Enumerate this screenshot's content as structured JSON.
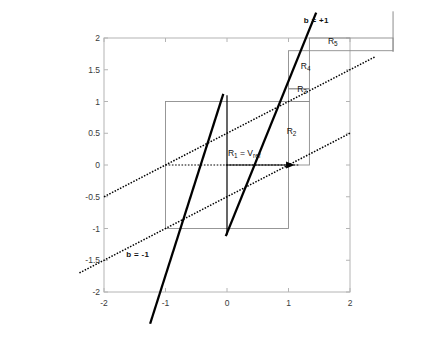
{
  "chart_data": {
    "type": "line",
    "title": "",
    "xlabel": "",
    "ylabel": "",
    "xlim": [
      -2,
      2
    ],
    "ylim": [
      -2,
      2
    ],
    "grid": false,
    "legend_position": "none",
    "x_ticks": [
      "-2",
      "-1",
      "0",
      "1",
      "2"
    ],
    "x_tick_values": [
      -2,
      -1,
      0,
      1,
      2
    ],
    "y_ticks": [
      "2",
      "1.5",
      "1",
      "0.5",
      "0",
      "-0.5",
      "-1",
      "-1.5",
      "-2"
    ],
    "y_tick_values": [
      2,
      1.5,
      1,
      0.5,
      0,
      -0.5,
      -1,
      -1.5,
      -2
    ],
    "series": [
      {
        "name": "b = +1",
        "style": "dotted",
        "color": "#000000",
        "slope": 0.5,
        "intercept": 0.5,
        "points": [
          [
            -2,
            -0.5
          ],
          [
            2.4,
            1.7
          ]
        ]
      },
      {
        "name": "b = -1",
        "style": "dotted",
        "color": "#000000",
        "slope": 0.5,
        "intercept": -0.5,
        "points": [
          [
            -2.4,
            -1.7
          ],
          [
            2.0,
            0.5
          ]
        ]
      },
      {
        "name": "map-branch-left",
        "style": "thick-solid",
        "color": "#000000",
        "points": [
          [
            -0.06,
            1.12
          ],
          [
            -1.25,
            -2.5
          ]
        ]
      },
      {
        "name": "map-branch-right",
        "style": "thick-solid",
        "color": "#000000",
        "points": [
          [
            -0.02,
            -1.12
          ],
          [
            1.45,
            2.4
          ]
        ]
      },
      {
        "name": "identity-vertical-x0",
        "style": "thin-solid",
        "color": "#000000",
        "points": [
          [
            0,
            1.1
          ],
          [
            0,
            -1.1
          ]
        ]
      }
    ],
    "annotations": [
      {
        "label": "b = +1",
        "x": 1.45,
        "y": 2.26,
        "bold": true
      },
      {
        "label": "b = -1",
        "x": -1.45,
        "y": -1.42,
        "bold": true
      },
      {
        "label": "R",
        "sub": "1",
        "suffix": " = V",
        "suffix_sub": "ref",
        "x": 0.28,
        "y": 0.18
      },
      {
        "label": "R",
        "sub": "2",
        "x": 1.05,
        "y": 0.52
      },
      {
        "label": "R",
        "sub": "3",
        "x": 1.22,
        "y": 1.18
      },
      {
        "label": "R",
        "sub": "4",
        "x": 1.28,
        "y": 1.55
      },
      {
        "label": "R",
        "sub": "5",
        "x": 1.72,
        "y": 1.93
      }
    ],
    "shapes": [
      {
        "name": "outer-axes-box",
        "type": "rect",
        "x0": -2,
        "y0": -2,
        "x1": 2,
        "y1": 2,
        "color": "#b0b0b0"
      },
      {
        "name": "inner-unit-box",
        "type": "rect",
        "x0": -1,
        "y0": -1,
        "x1": 1,
        "y1": 1,
        "color": "#8d8d8d"
      },
      {
        "name": "R2-region-box",
        "type": "rect",
        "x0": 1,
        "y0": 0,
        "x1": 1.34,
        "y1": 1,
        "color": "#8d8d8d"
      },
      {
        "name": "R3-region-box",
        "type": "rect",
        "x0": 1,
        "y0": 1,
        "x1": 1.34,
        "y1": 1.2,
        "color": "#8d8d8d"
      },
      {
        "name": "R4-region-box",
        "type": "rect",
        "x0": 1,
        "y0": 1.2,
        "x1": 1.34,
        "y1": 1.8,
        "color": "#8d8d8d"
      },
      {
        "name": "R5-region-box",
        "type": "rect",
        "x0": 1.34,
        "y0": 1.8,
        "x1": 2.7,
        "y1": 2,
        "color": "#8d8d8d"
      },
      {
        "name": "vref-arrow",
        "type": "arrow",
        "x0": -1,
        "y0": 0,
        "x1": 1.18,
        "y1": 0,
        "color": "#000000"
      }
    ]
  },
  "meta": {
    "width": 437,
    "height": 344
  }
}
